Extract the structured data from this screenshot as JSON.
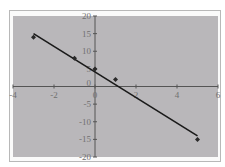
{
  "chart_data": {
    "type": "scatter",
    "title": "",
    "xlabel": "",
    "ylabel": "",
    "xlim": [
      -4,
      6
    ],
    "ylim": [
      -20,
      20
    ],
    "x_ticks": [
      -4,
      -2,
      0,
      2,
      4,
      6
    ],
    "y_ticks": [
      -20,
      -15,
      -10,
      -5,
      0,
      5,
      10,
      15,
      20
    ],
    "x_tick_labels": [
      "-4",
      "-2",
      "0",
      "2",
      "4",
      "6"
    ],
    "y_tick_labels": [
      "-20",
      "-15",
      "-10",
      "-5",
      "0",
      "5",
      "10",
      "15",
      "20"
    ],
    "grid": false,
    "legend": null,
    "series": [
      {
        "name": "data",
        "type": "scatter",
        "x": [
          -3,
          -1,
          0,
          1,
          5
        ],
        "y": [
          14,
          8,
          5,
          2,
          -15
        ]
      },
      {
        "name": "trendline",
        "type": "line",
        "x": [
          -3,
          5
        ],
        "y": [
          15,
          -14
        ]
      }
    ]
  },
  "colors": {
    "plot_background": "#b9b7ba",
    "line": "#1a1a1a",
    "marker": "#2a2a2a",
    "axis": "#555555",
    "frame_border": "#b8b8b8"
  }
}
